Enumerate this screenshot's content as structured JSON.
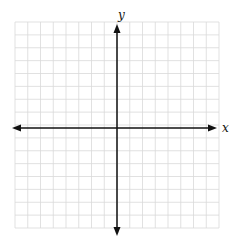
{
  "diagram": {
    "type": "coordinate-plane",
    "grid": {
      "left": 15,
      "top": 22,
      "right": 219,
      "bottom": 228,
      "cols": 16,
      "rows": 16,
      "line_color": "#d9d9d9"
    },
    "axes": {
      "color": "#111111",
      "origin": {
        "x": 117,
        "y": 128
      },
      "x_axis": {
        "from": 12,
        "to": 217,
        "label": "x"
      },
      "y_axis": {
        "from": 24,
        "to": 236,
        "label": "y"
      }
    }
  }
}
